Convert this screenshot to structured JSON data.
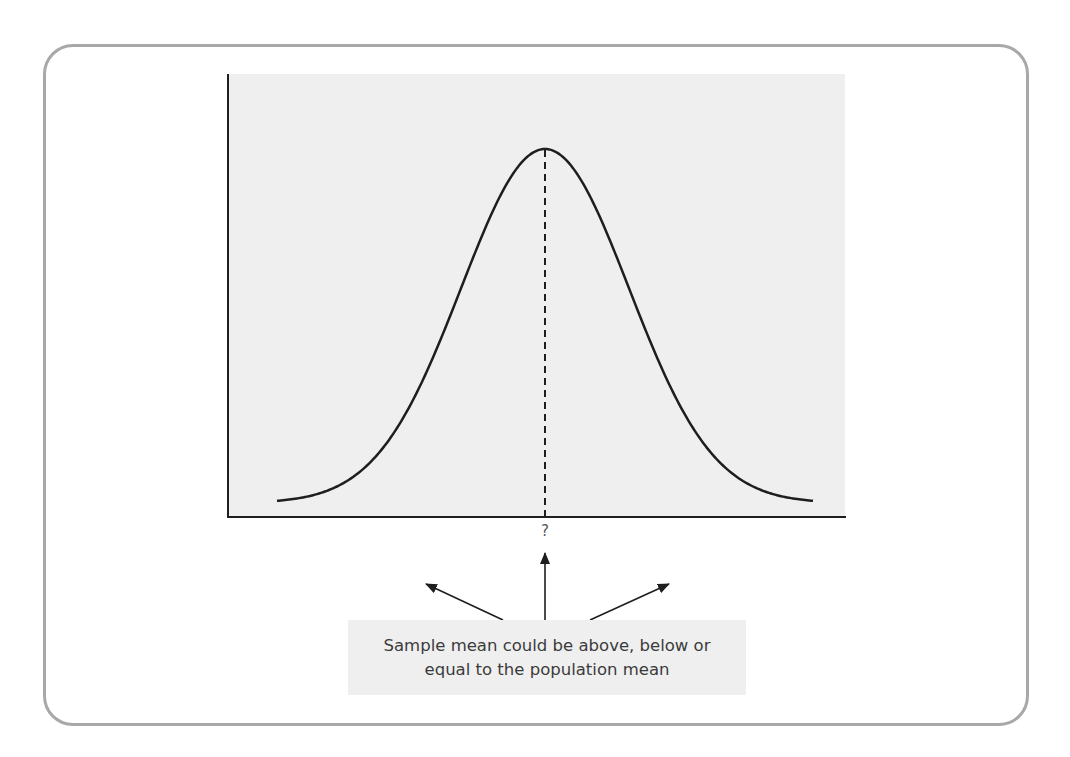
{
  "diagram": {
    "type": "normal-distribution",
    "title": "",
    "curve": {
      "shape": "bell",
      "mean_marker": "dashed-vertical-line"
    },
    "axis_label_mean": "?",
    "arrows": [
      {
        "direction": "left-up",
        "meaning": "below"
      },
      {
        "direction": "up",
        "meaning": "equal"
      },
      {
        "direction": "right-up",
        "meaning": "above"
      }
    ],
    "caption": {
      "line1": "Sample mean could be above, below or",
      "line2": "equal to the population mean"
    },
    "colors": {
      "plot_background": "#efefef",
      "curve": "#1e1e1e",
      "card_border": "#a8a8a8",
      "caption_background": "#efefef",
      "caption_text": "#3b3b3b"
    }
  }
}
